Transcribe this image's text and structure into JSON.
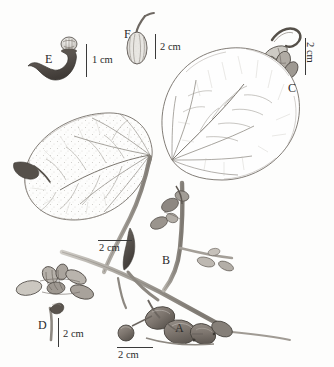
{
  "plate": {
    "type": "botanical-scientific-illustration",
    "subject": "Ficus-like climbing plant with cordate leaves, figs and floral details",
    "technique": "pen-and-ink stipple drawing, greyscale",
    "background_color": "#fdfdfc",
    "ink_color": "#3a3a3a"
  },
  "labels": [
    {
      "id": "A",
      "letter": "A",
      "x": 175,
      "y": 329,
      "desc": "fruiting branch with figs"
    },
    {
      "id": "B",
      "letter": "B",
      "x": 162,
      "y": 261,
      "desc": "stem node with bracts"
    },
    {
      "id": "C",
      "letter": "C",
      "x": 288,
      "y": 89,
      "desc": "detached flower cluster"
    },
    {
      "id": "D",
      "letter": "D",
      "x": 38,
      "y": 326,
      "desc": "single stalked organ"
    },
    {
      "id": "E",
      "letter": "E",
      "x": 45,
      "y": 60,
      "desc": "dark hooked structure with pale cap"
    },
    {
      "id": "F",
      "letter": "F",
      "x": 124,
      "y": 35,
      "desc": "ribbed ovoid fruit with curved stalk"
    }
  ],
  "scale_bars": [
    {
      "id": "scale-e",
      "text": "1 cm",
      "orientation": "vertical",
      "bar_x": 86,
      "bar_y": 44,
      "bar_len": 33,
      "text_x": 92,
      "text_y": 55
    },
    {
      "id": "scale-f",
      "text": "2 cm",
      "orientation": "vertical",
      "bar_x": 155,
      "bar_y": 34,
      "bar_len": 25,
      "text_x": 160,
      "text_y": 42
    },
    {
      "id": "scale-c",
      "text": "2 cm",
      "orientation": "vertical-rotated",
      "bar_x": 305,
      "bar_y": 38,
      "bar_len": 37,
      "text_x": 315,
      "text_y": 42
    },
    {
      "id": "scale-d",
      "text": "2 cm",
      "orientation": "vertical",
      "bar_x": 58,
      "bar_y": 318,
      "bar_len": 29,
      "text_x": 63,
      "text_y": 329
    },
    {
      "id": "scale-leaf",
      "text": "2 cm",
      "orientation": "horizontal",
      "bar_x": 98,
      "bar_y": 240,
      "bar_len": 34,
      "text_x": 99,
      "text_y": 243
    },
    {
      "id": "scale-a",
      "text": "2 cm",
      "orientation": "horizontal",
      "bar_x": 117,
      "bar_y": 347,
      "bar_len": 36,
      "text_x": 118,
      "text_y": 350
    }
  ],
  "elements": {
    "leaf_upper": {
      "name": "upper-cordate-leaf",
      "venation": "palmate-with-pinnate-secondaries",
      "texture": "smooth"
    },
    "leaf_lower": {
      "name": "lower-cordate-leaf",
      "venation": "palmate-with-pinnate-secondaries",
      "texture": "stippled-pubescent"
    },
    "stem_main": {
      "name": "main-climbing-stem"
    },
    "fig_cluster": {
      "name": "fig-fruit-cluster",
      "count": 5
    },
    "bud_cluster": {
      "name": "unlabeled-bud-cluster"
    },
    "stipule_left": {
      "name": "left-stipule"
    }
  }
}
